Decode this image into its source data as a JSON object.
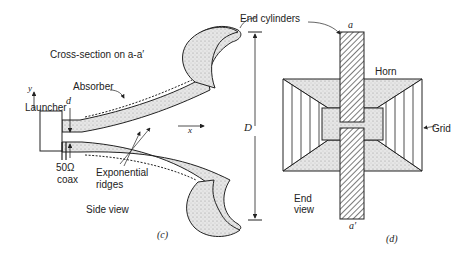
{
  "panels": [
    {
      "id": "c",
      "caption": "(c)",
      "title": "Cross-section on a-a′",
      "view_label": "Side view",
      "labels": {
        "absorber": "Absorber",
        "launcher": "Launcher",
        "d": "d",
        "y": "y",
        "x": "x",
        "coax_impedance": "50Ω",
        "coax": "coax",
        "exponential": "Exponential",
        "ridges": "ridges",
        "D": "D"
      }
    },
    {
      "id": "d",
      "caption": "(d)",
      "view_label_line1": "End",
      "view_label_line2": "view",
      "labels": {
        "end_cylinders": "End cylinders",
        "a_top": "a",
        "a_bottom": "a′",
        "horn": "Horn",
        "grid": "Grid"
      }
    }
  ],
  "colors": {
    "ink": "#222222",
    "fill": "#d9d9d9"
  }
}
